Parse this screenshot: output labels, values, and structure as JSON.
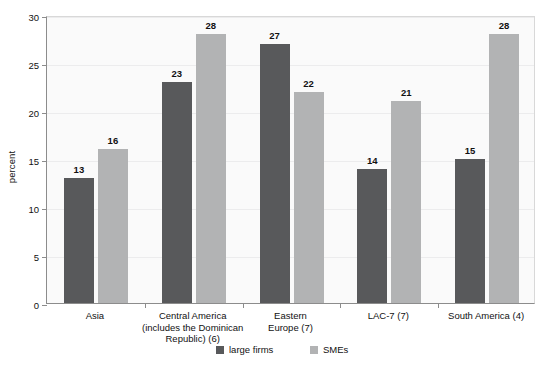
{
  "chart_data": {
    "type": "bar",
    "title": "",
    "xlabel": "",
    "ylabel": "percent",
    "ylim": [
      0,
      30
    ],
    "ytick_values": [
      0,
      5,
      10,
      15,
      20,
      25,
      30
    ],
    "ytick_labels": [
      "0",
      "5",
      "10",
      "15",
      "20",
      "25",
      "30"
    ],
    "grid": true,
    "legend_position": "bottom-center",
    "categories": [
      "Asia",
      "Central America (includes the Dominican Republic) (6)",
      "Eastern Europe (7)",
      "LAC-7 (7)",
      "South America (4)"
    ],
    "category_lines": [
      [
        "Asia"
      ],
      [
        "Central America",
        "(includes the Dominican",
        "Republic) (6)"
      ],
      [
        "Eastern",
        "Europe (7)"
      ],
      [
        "LAC-7 (7)"
      ],
      [
        "South America (4)"
      ]
    ],
    "series": [
      {
        "name": "large firms",
        "color": "#58595b",
        "values": [
          13,
          23,
          27,
          14,
          15
        ],
        "labels": [
          "13",
          "23",
          "27",
          "14",
          "15"
        ]
      },
      {
        "name": "SMEs",
        "color": "#b2b3b4",
        "values": [
          16,
          28,
          22,
          21,
          28
        ],
        "labels": [
          "16",
          "28",
          "22",
          "21",
          "28"
        ]
      }
    ]
  },
  "legend": {
    "items": [
      {
        "label": "large firms",
        "swatch": "dark"
      },
      {
        "label": "SMEs",
        "swatch": "light"
      }
    ]
  },
  "colors": {
    "large_firms": "#58595b",
    "smes": "#b2b3b4",
    "plot_background": "#fafafa",
    "axis": "#8c8c8c",
    "gridline": "#ececed",
    "text": "#111111"
  }
}
